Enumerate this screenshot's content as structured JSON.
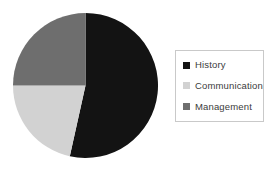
{
  "chart_data": {
    "type": "pie",
    "title": "",
    "subtitle": "",
    "xlabel": "",
    "ylabel": "",
    "grid": false,
    "legend_position": "right",
    "categories": [
      "History",
      "Communication",
      "Management"
    ],
    "values": [
      53.5,
      21.5,
      25.0
    ],
    "units": "percent",
    "colors": [
      "#131313",
      "#d2d2d2",
      "#6e6e6e"
    ],
    "start_angle_deg": 0,
    "direction": "clockwise",
    "slices": [
      {
        "label": "History",
        "value": 53.5,
        "color": "#131313",
        "start_deg": 0,
        "end_deg": 192.5
      },
      {
        "label": "Communication",
        "value": 21.5,
        "color": "#d2d2d2",
        "start_deg": 192.5,
        "end_deg": 270
      },
      {
        "label": "Management",
        "value": 25.0,
        "color": "#6e6e6e",
        "start_deg": 270,
        "end_deg": 360
      }
    ]
  },
  "legend": {
    "items": [
      {
        "label": "History",
        "color": "#131313"
      },
      {
        "label": "Communication",
        "color": "#d2d2d2"
      },
      {
        "label": "Management",
        "color": "#6e6e6e"
      }
    ]
  },
  "colors": {
    "background": "#ffffff",
    "legend_border": "#c9c9c9",
    "legend_text": "#3b3b3b"
  }
}
